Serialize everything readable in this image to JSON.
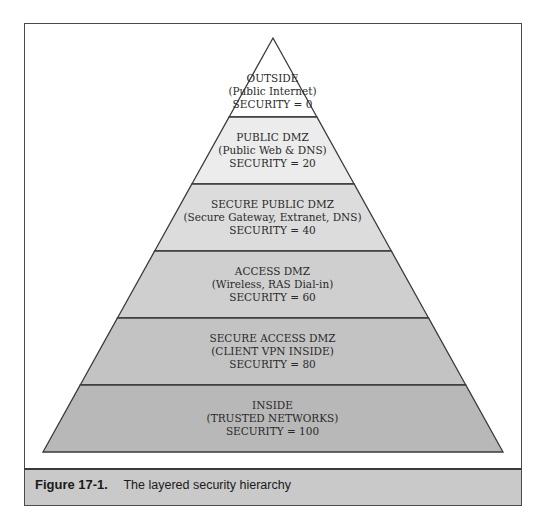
{
  "figure": {
    "number": "Figure 17-1.",
    "caption": "The layered security hierarchy"
  },
  "pyramid": {
    "apex": [
      273,
      38
    ],
    "base_left": [
      43,
      452
    ],
    "base_right": [
      503,
      452
    ],
    "layers": [
      {
        "title": "OUTSIDE",
        "subtitle": "(Public Internet)",
        "security": "SECURITY = 0",
        "fill": "#ffffff",
        "y_top": 38,
        "y_bottom": 117
      },
      {
        "title": "PUBLIC DMZ",
        "subtitle": "(Public Web & DNS)",
        "security": "SECURITY = 20",
        "fill": "#ececec",
        "y_top": 117,
        "y_bottom": 184
      },
      {
        "title": "SECURE PUBLIC DMZ",
        "subtitle": "(Secure Gateway, Extranet, DNS)",
        "security": "SECURITY = 40",
        "fill": "#dcdcdc",
        "y_top": 184,
        "y_bottom": 251
      },
      {
        "title": "ACCESS DMZ",
        "subtitle": "(Wireless, RAS Dial-in)",
        "security": "SECURITY = 60",
        "fill": "#cfcfcf",
        "y_top": 251,
        "y_bottom": 318
      },
      {
        "title": "SECURE ACCESS DMZ",
        "subtitle": "(CLIENT VPN INSIDE)",
        "security": "SECURITY = 80",
        "fill": "#c3c3c3",
        "y_top": 318,
        "y_bottom": 385
      },
      {
        "title": "INSIDE",
        "subtitle": "(TRUSTED NETWORKS)",
        "security": "SECURITY = 100",
        "fill": "#b8b8b8",
        "y_top": 385,
        "y_bottom": 452
      }
    ]
  },
  "colors": {
    "outline": "#3a3a3a",
    "caption_bg": "#c9c9c9"
  }
}
